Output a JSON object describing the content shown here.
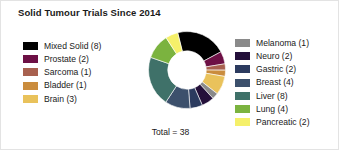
{
  "chart_data": {
    "type": "pie",
    "variant": "donut",
    "title": "Solid Tumour Trials Since 2014",
    "xlabel": "",
    "ylabel": "",
    "total_label": "Total = 38",
    "total": 38,
    "units": "trials",
    "legend_position": "left-and-right",
    "grid": false,
    "start_angle_deg": -104,
    "direction": "clockwise",
    "inner_radius_ratio": 0.5,
    "categories": [
      "Mixed Solid",
      "Prostate",
      "Sarcoma",
      "Bladder",
      "Brain",
      "Melanoma",
      "Neuro",
      "Gastric",
      "Breast",
      "Liver",
      "Lung",
      "Pancreatic"
    ],
    "values": [
      8,
      2,
      1,
      1,
      3,
      1,
      2,
      2,
      4,
      8,
      4,
      2
    ],
    "colors": [
      "#000000",
      "#6d1045",
      "#a8614f",
      "#ca8c3d",
      "#e9c25b",
      "#8a8a8a",
      "#24103a",
      "#2c3b5f",
      "#3c506c",
      "#3f7169",
      "#7bb33f",
      "#f5f06a"
    ],
    "slices": [
      {
        "label": "Mixed Solid",
        "value": 8,
        "legend_text": "Mixed Solid (8)",
        "color": "#000000",
        "column": "left"
      },
      {
        "label": "Prostate",
        "value": 2,
        "legend_text": "Prostate (2)",
        "color": "#6d1045",
        "column": "left"
      },
      {
        "label": "Sarcoma",
        "value": 1,
        "legend_text": "Sarcoma (1)",
        "color": "#a8614f",
        "column": "left"
      },
      {
        "label": "Bladder",
        "value": 1,
        "legend_text": "Bladder (1)",
        "color": "#ca8c3d",
        "column": "left"
      },
      {
        "label": "Brain",
        "value": 3,
        "legend_text": "Brain (3)",
        "color": "#e9c25b",
        "column": "left"
      },
      {
        "label": "Melanoma",
        "value": 1,
        "legend_text": "Melanoma (1)",
        "color": "#8a8a8a",
        "column": "right"
      },
      {
        "label": "Neuro",
        "value": 2,
        "legend_text": "Neuro (2)",
        "color": "#24103a",
        "column": "right"
      },
      {
        "label": "Gastric",
        "value": 2,
        "legend_text": "Gastric (2)",
        "color": "#2c3b5f",
        "column": "right"
      },
      {
        "label": "Breast",
        "value": 4,
        "legend_text": "Breast (4)",
        "color": "#3c506c",
        "column": "right"
      },
      {
        "label": "Liver",
        "value": 8,
        "legend_text": "Liver (8)",
        "color": "#3f7169",
        "column": "right"
      },
      {
        "label": "Lung",
        "value": 4,
        "legend_text": "Lung (4)",
        "color": "#7bb33f",
        "column": "right"
      },
      {
        "label": "Pancreatic",
        "value": 2,
        "legend_text": "Pancreatic (2)",
        "color": "#f5f06a",
        "column": "right"
      }
    ]
  },
  "legend_left": [
    "Mixed Solid (8)",
    "Prostate (2)",
    "Sarcoma (1)",
    "Bladder (1)",
    "Brain (3)"
  ],
  "legend_right": [
    "Melanoma (1)",
    "Neuro (2)",
    "Gastric (2)",
    "Breast (4)",
    "Liver (8)",
    "Lung (4)",
    "Pancreatic (2)"
  ]
}
